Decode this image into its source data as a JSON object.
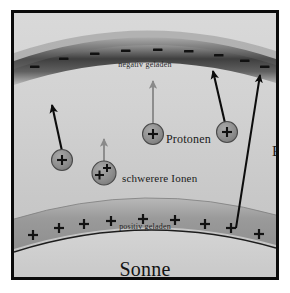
{
  "figure": {
    "title_visible": false,
    "frame_color": "#0b0b0b",
    "background_color": "#ffffff"
  },
  "diagram": {
    "type": "solar-atmosphere-charge-separation",
    "colors": {
      "negative_band": "#3a3a3a",
      "positive_band": "#9a9a9a",
      "sun_body": "#d2d2d2",
      "sky_top": "#d6d6d6",
      "sky_bottom": "#c4c4c4",
      "particle_fill": "#8e8e8e",
      "particle_stroke": "#3d3d3d",
      "arrow_dark": "#0c0c0c",
      "arrow_gray": "#8a8a8a",
      "text": "#1a1a1a"
    },
    "bands": {
      "negative": {
        "label": "negativ geladen",
        "sign": "–",
        "sign_count": 9
      },
      "positive": {
        "label": "positiv geladen",
        "sign": "+",
        "sign_count": 9
      }
    },
    "sun": {
      "label": "Sonne"
    },
    "labels": {
      "protonen": "Protonen",
      "schwerere_ionen": "schwerere Ionen",
      "efield": "E"
    },
    "particles": [
      {
        "name": "proton-left",
        "charge": "+",
        "charge_count": 1,
        "cx": 52,
        "cy": 155
      },
      {
        "name": "heavy-ion",
        "charge": "+",
        "charge_count": 2,
        "cx": 97,
        "cy": 168
      },
      {
        "name": "proton-mid",
        "charge": "+",
        "charge_count": 1,
        "cx": 146,
        "cy": 128
      },
      {
        "name": "proton-right",
        "charge": "+",
        "charge_count": 1,
        "cx": 218,
        "cy": 126
      }
    ],
    "arrows": [
      {
        "name": "arrow-proton-left",
        "style": "dark",
        "length": "long"
      },
      {
        "name": "arrow-heavy-ion",
        "style": "gray",
        "length": "short"
      },
      {
        "name": "arrow-proton-mid",
        "style": "gray",
        "length": "long"
      },
      {
        "name": "arrow-proton-right",
        "style": "dark",
        "length": "long"
      },
      {
        "name": "arrow-efield",
        "style": "dark",
        "length": "full"
      }
    ]
  }
}
